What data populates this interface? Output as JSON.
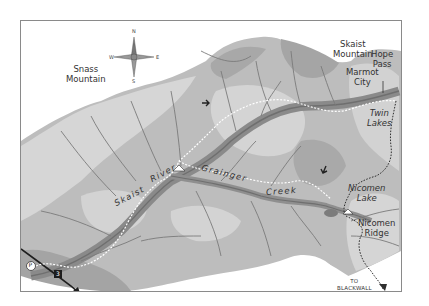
{
  "map": {
    "type": "trail-map",
    "colors": {
      "background": "#ffffff",
      "frame": "#8a8a8a",
      "terrain_light": "#d8d8d8",
      "terrain_mid": "#bdbdbd",
      "terrain_dark": "#9d9d9d",
      "river": "#7e7e7e",
      "trail": "#ffffff",
      "trail_alt": "#3a3a3a",
      "road": "#1e1e1e"
    },
    "compass": {
      "n": "N",
      "s": "S",
      "e": "E",
      "w": "W"
    },
    "labels": {
      "snass_mountain": [
        "Snass",
        "Mountain"
      ],
      "skaist_mountain": [
        "Skaist",
        "Mountain"
      ],
      "hope_pass": [
        "Hope",
        "Pass"
      ],
      "marmot_city": [
        "Marmot",
        "City"
      ],
      "twin_lakes": [
        "Twin",
        "Lakes"
      ],
      "nicomen_lake": [
        "Nicomen",
        "Lake"
      ],
      "nicomen_ridge": [
        "Nicomen",
        "Ridge"
      ],
      "skaist_river_1": "Skaist",
      "skaist_river_2": "River",
      "grainger_creek_1": "Grainger",
      "grainger_creek_2": "Creek",
      "to_princeton": "TO PRINCETON",
      "to_blackwall_peak": [
        "TO",
        "BLACKWALL",
        "PEAK"
      ]
    },
    "icons": {
      "parking": "P",
      "highway_shield": "3"
    }
  }
}
